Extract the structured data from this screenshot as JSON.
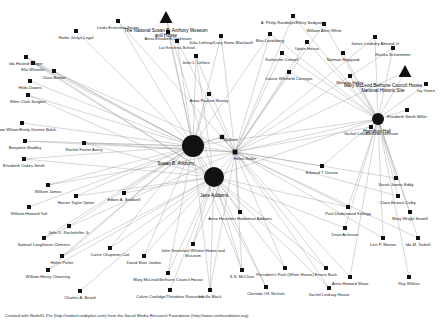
{
  "meta": {
    "footer": "Created with NodeXL Pro (http://nodexl.codeplex.com) from the Social Media Research Foundation (http://www.smrfoundation.org)"
  },
  "colors": {
    "node_fill": "#111111",
    "edge": "#8d8d8d",
    "label": "#1a1a1a",
    "background": "#ffffff"
  },
  "chart_data": {
    "type": "scatter",
    "xlabel": "",
    "ylabel": "",
    "layout": "force-directed",
    "grid": false,
    "legend": "none",
    "shapes": {
      "circle": "person hub",
      "square": "person",
      "triangle": "place / museum / historic site"
    },
    "nodes": [
      {
        "id": "susan-b-anthony",
        "label": "Susan B. Anthony",
        "x": 193,
        "y": 146,
        "size": 11,
        "shape": "circle",
        "label_dx": -17,
        "label_dy": 5
      },
      {
        "id": "jane-addams",
        "label": "Jane Addams",
        "x": 214,
        "y": 177,
        "size": 10,
        "shape": "circle",
        "label_dx": 0,
        "label_dy": 7
      },
      {
        "id": "helen-keller",
        "label": "Helen Keller",
        "x": 235,
        "y": 152,
        "size": 2.4,
        "shape": "square",
        "label_dx": 10,
        "label_dy": 3
      },
      {
        "id": "bullock",
        "label": "Bullock",
        "x": 222,
        "y": 137,
        "size": 2.2,
        "shape": "square",
        "label_dx": 9,
        "label_dy": -1
      },
      {
        "id": "hamilton-hall",
        "label": "Hamilton Hall",
        "x": 378,
        "y": 119,
        "size": 6,
        "shape": "circle",
        "label_dx": -1,
        "label_dy": 5
      },
      {
        "id": "ida-husted-harper",
        "label": "Ida Husted Harper",
        "x": 26,
        "y": 57,
        "size": 2,
        "shape": "square",
        "label_dx": 0,
        "label_dy": 3
      },
      {
        "id": "hattie-joslyn-legal",
        "label": "Hattie Joslyn Legal",
        "x": 76,
        "y": 31,
        "size": 2,
        "shape": "square",
        "label_dx": 0,
        "label_dy": 3
      },
      {
        "id": "linda-ernestine-sector",
        "label": "Linda Ernestine Sector",
        "x": 118,
        "y": 21,
        "size": 2,
        "shape": "square",
        "label_dx": 0,
        "label_dy": 3
      },
      {
        "id": "anna-elizabeth-dickinson",
        "label": "Anna Elizabeth Dickinson",
        "x": 168,
        "y": 32,
        "size": 2,
        "shape": "square",
        "label_dx": 0,
        "label_dy": 3
      },
      {
        "id": "lat-kreshna-school",
        "label": "Lat Kreshna School",
        "x": 177,
        "y": 41,
        "size": 2,
        "shape": "square",
        "label_dx": 0,
        "label_dy": 3
      },
      {
        "id": "national-susan-b-anthony-museum",
        "label": "The National Susan B. Anthony Museum\nand House",
        "x": 166,
        "y": 18,
        "size": 7,
        "shape": "triangle",
        "label_dx": 0,
        "label_dy": 4
      },
      {
        "id": "julia-lathrop-lucy-stone-blackwell",
        "label": "Julia Lathrop/Lucy Stone Blackwell",
        "x": 221,
        "y": 36,
        "size": 2,
        "shape": "square",
        "label_dx": 0,
        "label_dy": 3
      },
      {
        "id": "a-philip-randolph-ellery-sedgwick",
        "label": "A. Philip Randolph/Ellery Sedgwick",
        "x": 293,
        "y": 16,
        "size": 2,
        "shape": "square",
        "label_dx": 0,
        "label_dy": 3
      },
      {
        "id": "william-allen-white",
        "label": "William Allen White",
        "x": 324,
        "y": 24,
        "size": 2,
        "shape": "square",
        "label_dx": 0,
        "label_dy": 3
      },
      {
        "id": "max-landsberg",
        "label": "Max Landsberg",
        "x": 270,
        "y": 34,
        "size": 2,
        "shape": "square",
        "label_dx": 0,
        "label_dy": 3
      },
      {
        "id": "james-lindsley-almond-jr",
        "label": "James Lindsley Almond Jr",
        "x": 375,
        "y": 37,
        "size": 2,
        "shape": "square",
        "label_dx": 0,
        "label_dy": 3
      },
      {
        "id": "upton-house",
        "label": "Upton House",
        "x": 307,
        "y": 42,
        "size": 2,
        "shape": "square",
        "label_dx": 0,
        "label_dy": 3
      },
      {
        "id": "katharine-connell",
        "label": "Katharine Connell",
        "x": 282,
        "y": 53,
        "size": 2,
        "shape": "square",
        "label_dx": 0,
        "label_dy": 3
      },
      {
        "id": "norman-hapgood",
        "label": "Norman Hapgood",
        "x": 343,
        "y": 53,
        "size": 2,
        "shape": "square",
        "label_dx": 0,
        "label_dy": 3
      },
      {
        "id": "rosika-schwimmer",
        "label": "Rosika Schwimmer",
        "x": 393,
        "y": 48,
        "size": 2,
        "shape": "square",
        "label_dx": 0,
        "label_dy": 3
      },
      {
        "id": "john-l-leflore",
        "label": "John L. Leflore",
        "x": 196,
        "y": 56,
        "size": 2,
        "shape": "square",
        "label_dx": 0,
        "label_dy": 3
      },
      {
        "id": "ella-wheeler",
        "label": "Ella Wheeler",
        "x": 33,
        "y": 63,
        "size": 2,
        "shape": "square",
        "label_dx": 0,
        "label_dy": 3
      },
      {
        "id": "mary-mcleod-bethune-council-house",
        "label": "Mary McLeod Bethune Council House\nNational Historic Site",
        "x": 405,
        "y": 72,
        "size": 7,
        "shape": "triangle",
        "label_dx": -22,
        "label_dy": 5
      },
      {
        "id": "ivy-green",
        "label": "Ivy Green",
        "x": 426,
        "y": 84,
        "size": 2,
        "shape": "square",
        "label_dx": 0,
        "label_dy": 3
      },
      {
        "id": "louise-whitfield-carnegie",
        "label": "Louise Whitfield Carnegie",
        "x": 289,
        "y": 72,
        "size": 2,
        "shape": "square",
        "label_dx": 0,
        "label_dy": 3
      },
      {
        "id": "marietta-holley",
        "label": "Marietta Holley",
        "x": 350,
        "y": 76,
        "size": 2,
        "shape": "square",
        "label_dx": 0,
        "label_dy": 3
      },
      {
        "id": "clara-barton",
        "label": "Clara Barton",
        "x": 54,
        "y": 71,
        "size": 2,
        "shape": "square",
        "label_dx": 0,
        "label_dy": 3
      },
      {
        "id": "hilda-dawes",
        "label": "Hilda Dawes",
        "x": 30,
        "y": 81,
        "size": 2,
        "shape": "square",
        "label_dx": 0,
        "label_dy": 3
      },
      {
        "id": "anna-pauline-murray",
        "label": "Anna Pauline Murray",
        "x": 209,
        "y": 94,
        "size": 2,
        "shape": "square",
        "label_dx": 0,
        "label_dy": 3
      },
      {
        "id": "ellen-clark-sargent",
        "label": "Ellen Clark Sargent",
        "x": 28,
        "y": 95,
        "size": 2,
        "shape": "square",
        "label_dx": 0,
        "label_dy": 3
      },
      {
        "id": "elizabeth-smith-miller",
        "label": "Elizabeth Smith Miller",
        "x": 407,
        "y": 110,
        "size": 2,
        "shape": "square",
        "label_dx": 0,
        "label_dy": 3
      },
      {
        "id": "woodrow-wilson-emily-greene-balch",
        "label": "Woodrow Wilson/Emily Greene Balch",
        "x": 22,
        "y": 123,
        "size": 2,
        "shape": "square",
        "label_dx": 0,
        "label_dy": 3
      },
      {
        "id": "benjamin-bradley",
        "label": "Benjamin Bradley",
        "x": 25,
        "y": 141,
        "size": 2,
        "shape": "square",
        "label_dx": 0,
        "label_dy": 3
      },
      {
        "id": "rachel-foster-avery",
        "label": "Rachel Foster Avery",
        "x": 84,
        "y": 143,
        "size": 2,
        "shape": "square",
        "label_dx": 0,
        "label_dy": 3
      },
      {
        "id": "vachel-lim-adelaide-johnson",
        "label": "Vachel Lim/Adelaide Johnson",
        "x": 371,
        "y": 127,
        "size": 2,
        "shape": "square",
        "label_dx": 0,
        "label_dy": 3
      },
      {
        "id": "elizabeth-oakes-smith",
        "label": "Elizabeth Oakes Smith",
        "x": 24,
        "y": 159,
        "size": 2,
        "shape": "square",
        "label_dx": 0,
        "label_dy": 3
      },
      {
        "id": "edward-t-devine",
        "label": "Edward T. Devine",
        "x": 322,
        "y": 166,
        "size": 2,
        "shape": "square",
        "label_dx": 0,
        "label_dy": 3
      },
      {
        "id": "sarah-james-eddy",
        "label": "Sarah James Eddy",
        "x": 396,
        "y": 178,
        "size": 2,
        "shape": "square",
        "label_dx": 0,
        "label_dy": 3
      },
      {
        "id": "william-james",
        "label": "William James",
        "x": 48,
        "y": 185,
        "size": 2,
        "shape": "square",
        "label_dx": 0,
        "label_dy": 3
      },
      {
        "id": "harriet-taylor-upton",
        "label": "Harriet Taylor Upton",
        "x": 76,
        "y": 196,
        "size": 2,
        "shape": "square",
        "label_dx": 0,
        "label_dy": 3
      },
      {
        "id": "edwin-a-studwell",
        "label": "Edwin A. Studwell",
        "x": 124,
        "y": 193,
        "size": 2,
        "shape": "square",
        "label_dx": 0,
        "label_dy": 3
      },
      {
        "id": "clara-bewick-colby",
        "label": "Clara Bewick Colby",
        "x": 398,
        "y": 196,
        "size": 2,
        "shape": "square",
        "label_dx": 0,
        "label_dy": 3
      },
      {
        "id": "william-howard-taft",
        "label": "William Howard Taft",
        "x": 29,
        "y": 207,
        "size": 2,
        "shape": "square",
        "label_dx": 0,
        "label_dy": 3
      },
      {
        "id": "paul-underwood-kellogg",
        "label": "Paul Underwood Kellogg",
        "x": 348,
        "y": 207,
        "size": 2,
        "shape": "square",
        "label_dx": 0,
        "label_dy": 3
      },
      {
        "id": "mary-wright-sewell",
        "label": "Mary Wright Sewell",
        "x": 410,
        "y": 212,
        "size": 2,
        "shape": "square",
        "label_dx": 0,
        "label_dy": 3
      },
      {
        "id": "anna-hostetter-haldeman-addams",
        "label": "Anna Hostetter Haldeman Addams",
        "x": 240,
        "y": 212,
        "size": 2,
        "shape": "square",
        "label_dx": 0,
        "label_dy": 3
      },
      {
        "id": "john-d-rockefeller-jr",
        "label": "John D. Rockefeller Jr.",
        "x": 69,
        "y": 226,
        "size": 2,
        "shape": "square",
        "label_dx": 0,
        "label_dy": 3
      },
      {
        "id": "dean-acheson",
        "label": "Dean Acheson",
        "x": 345,
        "y": 228,
        "size": 2,
        "shape": "square",
        "label_dx": 0,
        "label_dy": 3
      },
      {
        "id": "samuel-langhorne-clemens",
        "label": "Samuel Langhorne Clemens",
        "x": 44,
        "y": 238,
        "size": 2,
        "shape": "square",
        "label_dx": 0,
        "label_dy": 3
      },
      {
        "id": "levi-p-morton",
        "label": "Levi P. Morton",
        "x": 383,
        "y": 238,
        "size": 2,
        "shape": "square",
        "label_dx": 0,
        "label_dy": 3
      },
      {
        "id": "ida-m-tarbell",
        "label": "Ida M. Tarbell",
        "x": 418,
        "y": 238,
        "size": 2,
        "shape": "square",
        "label_dx": 0,
        "label_dy": 3
      },
      {
        "id": "carrie-chapman-catt",
        "label": "Carrie Chapman Catt",
        "x": 110,
        "y": 248,
        "size": 2,
        "shape": "square",
        "label_dx": 0,
        "label_dy": 3
      },
      {
        "id": "david-starr-jordan",
        "label": "David Starr Jordan",
        "x": 144,
        "y": 256,
        "size": 2,
        "shape": "square",
        "label_dx": 0,
        "label_dy": 3
      },
      {
        "id": "john-greenleaf-whittier-home",
        "label": "John Greenleaf Whittier Home and\nMuseum",
        "x": 193,
        "y": 244,
        "size": 2,
        "shape": "square",
        "label_dx": 0,
        "label_dy": 3
      },
      {
        "id": "helen-potter",
        "label": "Helen Potter",
        "x": 62,
        "y": 256,
        "size": 2,
        "shape": "square",
        "label_dx": 0,
        "label_dy": 3
      },
      {
        "id": "presidents-park-white-house",
        "label": "President's Park (White House)",
        "x": 285,
        "y": 268,
        "size": 2,
        "shape": "square",
        "label_dx": 0,
        "label_dy": 3
      },
      {
        "id": "ernest-buck",
        "label": "Ernest Buck",
        "x": 326,
        "y": 268,
        "size": 2,
        "shape": "square",
        "label_dx": 0,
        "label_dy": 3
      },
      {
        "id": "william-henry-channing",
        "label": "William Henry Channing",
        "x": 48,
        "y": 270,
        "size": 2,
        "shape": "square",
        "label_dx": 0,
        "label_dy": 3
      },
      {
        "id": "ss-mcclure",
        "label": "S.S. McClure",
        "x": 242,
        "y": 270,
        "size": 2,
        "shape": "square",
        "label_dx": 0,
        "label_dy": 3
      },
      {
        "id": "mary-mcleod-bethune-house",
        "label": "Mary McLeod Bethune Council House",
        "x": 168,
        "y": 273,
        "size": 2,
        "shape": "square",
        "label_dx": 0,
        "label_dy": 3
      },
      {
        "id": "anna-howard-shaw",
        "label": "Anna Howard Shaw",
        "x": 350,
        "y": 277,
        "size": 2,
        "shape": "square",
        "label_dx": 0,
        "label_dy": 3
      },
      {
        "id": "roy-wilkins",
        "label": "Roy Wilkins",
        "x": 409,
        "y": 277,
        "size": 2,
        "shape": "square",
        "label_dx": 0,
        "label_dy": 3
      },
      {
        "id": "charles-a-beard",
        "label": "Charles A. Beard",
        "x": 80,
        "y": 291,
        "size": 2,
        "shape": "square",
        "label_dx": 0,
        "label_dy": 3
      },
      {
        "id": "calvin-coolidge-theodore-roosevelt",
        "label": "Calvin Coolidge/Theodore Roosevelt",
        "x": 170,
        "y": 290,
        "size": 2,
        "shape": "square",
        "label_dx": 0,
        "label_dy": 3
      },
      {
        "id": "lucille-black",
        "label": "Lucille Black",
        "x": 210,
        "y": 290,
        "size": 2,
        "shape": "square",
        "label_dx": 0,
        "label_dy": 3
      },
      {
        "id": "clarinda-ih-nichols",
        "label": "Clarinda I.H. Nichols",
        "x": 266,
        "y": 287,
        "size": 2,
        "shape": "square",
        "label_dx": 0,
        "label_dy": 3
      },
      {
        "id": "vachel-lindsay-house",
        "label": "Vachel Lindsay House",
        "x": 329,
        "y": 288,
        "size": 2,
        "shape": "square",
        "label_dx": 0,
        "label_dy": 3
      }
    ],
    "hubs": [
      "susan-b-anthony",
      "jane-addams",
      "helen-keller",
      "hamilton-hall"
    ],
    "edge_count": 118
  }
}
